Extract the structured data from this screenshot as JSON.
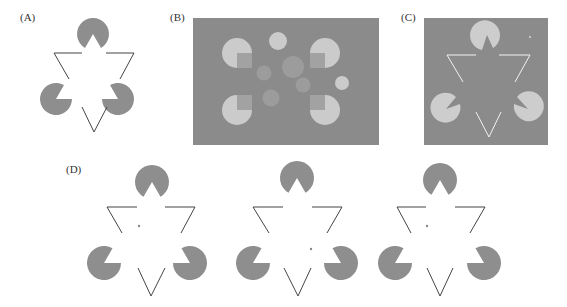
{
  "colors": {
    "inducer_gray": "#8e8e8e",
    "panel_bg": "#8b8b8b",
    "light_disk": "#cbcbcb",
    "mid_disk": "#a0a0a0",
    "line_dark": "#444444",
    "line_white": "#f2f2f2",
    "dot": "#888888"
  },
  "panels": [
    {
      "id": "A",
      "label": "(A)",
      "label_pos": [
        20,
        11
      ]
    },
    {
      "id": "B",
      "label": "(B)",
      "label_pos": [
        170,
        11
      ]
    },
    {
      "id": "C",
      "label": "(C)",
      "label_pos": [
        401,
        11
      ]
    },
    {
      "id": "D",
      "label": "(D)",
      "label_pos": [
        66,
        163
      ]
    }
  ]
}
